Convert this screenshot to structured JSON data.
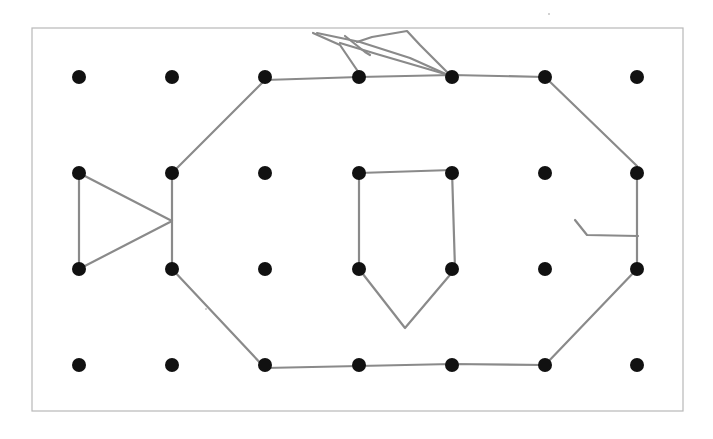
{
  "page": {
    "background": "#ffffff",
    "width": 713,
    "height": 439
  },
  "frame": {
    "x": 32,
    "y": 28,
    "width": 651,
    "height": 383,
    "stroke": "#b8b8b8"
  },
  "grid": {
    "cols_x": [
      79,
      172,
      265,
      359,
      452,
      545,
      637
    ],
    "rows_y": [
      77,
      173,
      269,
      365
    ],
    "dot_radius": 7,
    "dot_color": "#111111"
  },
  "drawing": {
    "stroke_color": "#8a8a8a",
    "stroke_width": 2.2,
    "fish_body": {
      "description": "octagon fish body outline",
      "points": [
        [
          265,
          80
        ],
        [
          359,
          77
        ],
        [
          452,
          75
        ],
        [
          545,
          77
        ],
        [
          637,
          166
        ],
        [
          637,
          269
        ],
        [
          545,
          365
        ],
        [
          452,
          364
        ],
        [
          359,
          366
        ],
        [
          265,
          368
        ],
        [
          172,
          269
        ],
        [
          172,
          173
        ],
        [
          265,
          80
        ]
      ]
    },
    "tail": {
      "description": "triangle tail",
      "points": [
        [
          79,
          173
        ],
        [
          79,
          269
        ],
        [
          172,
          221
        ],
        [
          79,
          173
        ]
      ]
    },
    "fin_inside": {
      "description": "pentagon fin inside body",
      "points": [
        [
          359,
          173
        ],
        [
          452,
          170
        ],
        [
          455,
          269
        ],
        [
          405,
          328
        ],
        [
          359,
          269
        ],
        [
          359,
          173
        ]
      ]
    },
    "mouth": {
      "description": "mouth stroke near right edge",
      "points": [
        [
          575,
          220
        ],
        [
          587,
          235
        ],
        [
          638,
          236
        ]
      ]
    },
    "dorsal_fin": {
      "description": "scribbled dorsal fin on top",
      "strokes": [
        [
          [
            313,
            33
          ],
          [
            340,
            45
          ],
          [
            359,
            73
          ]
        ],
        [
          [
            317,
            33
          ],
          [
            360,
            42
          ],
          [
            410,
            58
          ],
          [
            448,
            75
          ]
        ],
        [
          [
            345,
            36
          ],
          [
            365,
            52
          ],
          [
            370,
            55
          ]
        ],
        [
          [
            340,
            43
          ],
          [
            380,
            55
          ],
          [
            445,
            74
          ]
        ],
        [
          [
            357,
            42
          ],
          [
            372,
            37
          ],
          [
            407,
            31
          ],
          [
            420,
            45
          ],
          [
            448,
            73
          ]
        ]
      ]
    },
    "specks": [
      {
        "x": 549,
        "y": 14
      },
      {
        "x": 206,
        "y": 309
      }
    ]
  }
}
